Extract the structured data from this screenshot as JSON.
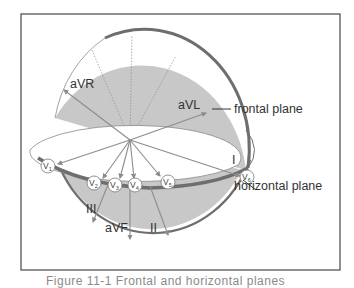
{
  "figure": {
    "labels": {
      "aVR": "aVR",
      "aVL": "aVL",
      "aVF": "aVF",
      "I": "I",
      "II": "II",
      "III": "III"
    },
    "callouts": {
      "frontal_plane": "frontal plane",
      "horizontal_plane": "horizontal plane"
    },
    "precordial_leads": [
      {
        "letter": "V",
        "sub": "1"
      },
      {
        "letter": "V",
        "sub": "2"
      },
      {
        "letter": "V",
        "sub": "3"
      },
      {
        "letter": "V",
        "sub": "4"
      },
      {
        "letter": "V",
        "sub": "5"
      },
      {
        "letter": "V",
        "sub": "6"
      }
    ],
    "caption": "Figure 11-1  Frontal and horizontal planes",
    "colors": {
      "disc_fill": "#c8c8c8",
      "rim": "#6e6e6e",
      "arrow": "#8c8c8c",
      "border": "#555555",
      "text": "#333333"
    }
  }
}
